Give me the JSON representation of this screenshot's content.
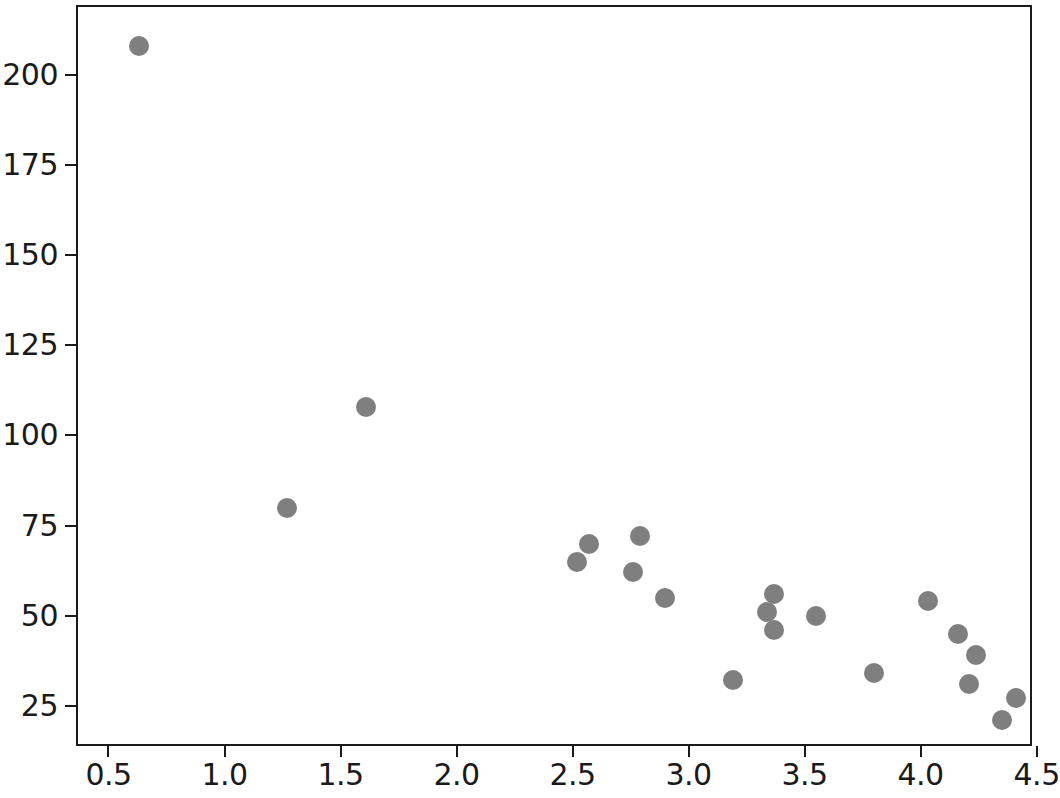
{
  "chart_data": {
    "type": "scatter",
    "title": "",
    "xlabel": "",
    "ylabel": "",
    "xlim": [
      0.36,
      4.48
    ],
    "ylim": [
      13.8,
      219.5
    ],
    "grid": false,
    "legend": null,
    "marker": {
      "color": "#7f7f7f",
      "shape": "circle",
      "size_px": 20
    },
    "xticks": [
      0.5,
      1.0,
      1.5,
      2.0,
      2.5,
      3.0,
      3.5,
      4.0,
      4.5
    ],
    "xticklabels": [
      "0.5",
      "1.0",
      "1.5",
      "2.0",
      "2.5",
      "3.0",
      "3.5",
      "4.0",
      "4.5"
    ],
    "yticks": [
      25,
      50,
      75,
      100,
      125,
      150,
      175,
      200
    ],
    "yticklabels": [
      "25",
      "50",
      "75",
      "100",
      "125",
      "150",
      "175",
      "200"
    ],
    "series": [
      {
        "name": "series-1",
        "points": [
          {
            "x": 0.63,
            "y": 208
          },
          {
            "x": 1.27,
            "y": 80
          },
          {
            "x": 1.61,
            "y": 108
          },
          {
            "x": 2.52,
            "y": 65
          },
          {
            "x": 2.57,
            "y": 70
          },
          {
            "x": 2.76,
            "y": 62
          },
          {
            "x": 2.79,
            "y": 72
          },
          {
            "x": 2.9,
            "y": 55
          },
          {
            "x": 3.19,
            "y": 32
          },
          {
            "x": 3.34,
            "y": 51
          },
          {
            "x": 3.37,
            "y": 56
          },
          {
            "x": 3.37,
            "y": 46
          },
          {
            "x": 3.55,
            "y": 50
          },
          {
            "x": 3.8,
            "y": 34
          },
          {
            "x": 4.03,
            "y": 54
          },
          {
            "x": 4.16,
            "y": 45
          },
          {
            "x": 4.21,
            "y": 31
          },
          {
            "x": 4.24,
            "y": 39
          },
          {
            "x": 4.35,
            "y": 21
          },
          {
            "x": 4.41,
            "y": 27
          }
        ]
      }
    ]
  },
  "figure": {
    "background": "#ffffff",
    "axis_color": "#1a1a1a"
  }
}
